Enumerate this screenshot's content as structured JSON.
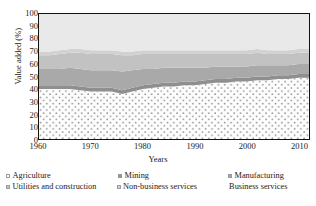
{
  "chart_data": {
    "type": "area",
    "title": "",
    "xlabel": "Years",
    "ylabel": "Value added (%)",
    "xlim": [
      1960,
      2012
    ],
    "ylim": [
      0,
      100
    ],
    "grid": false,
    "stacked": true,
    "legend_position": "bottom",
    "xticks": [
      1960,
      1970,
      1980,
      1990,
      2000,
      2010
    ],
    "yticks": [
      0,
      10,
      20,
      30,
      40,
      50,
      60,
      70,
      80,
      90,
      100
    ],
    "x": [
      1960,
      1962,
      1964,
      1966,
      1968,
      1970,
      1972,
      1974,
      1976,
      1978,
      1980,
      1982,
      1984,
      1986,
      1988,
      1990,
      1992,
      1994,
      1996,
      1998,
      2000,
      2002,
      2004,
      2006,
      2008,
      2010,
      2012
    ],
    "series": [
      {
        "name": "Agriculture",
        "color": "#fdfdfd",
        "pattern": "dots",
        "values": [
          40,
          40,
          40,
          40,
          39,
          38,
          38,
          38,
          36,
          38,
          40,
          41,
          42,
          42,
          43,
          43,
          44,
          45,
          45,
          46,
          46,
          47,
          47,
          48,
          48,
          49,
          49
        ]
      },
      {
        "name": "Mining",
        "color": "#8f8f8f",
        "values": [
          3,
          3,
          3,
          3,
          3,
          3,
          3,
          3,
          3,
          3,
          3,
          3,
          3,
          3,
          3,
          3,
          3,
          3,
          3,
          3,
          3,
          3,
          3,
          3,
          3,
          3,
          3
        ]
      },
      {
        "name": "Manufacturing",
        "color": "#a9a9a9",
        "values": [
          13,
          13,
          13,
          14,
          14,
          14,
          14,
          14,
          15,
          14,
          13,
          12,
          12,
          12,
          11,
          11,
          10,
          10,
          10,
          9,
          9,
          9,
          9,
          8,
          8,
          8,
          8
        ]
      },
      {
        "name": "Utilities and construction",
        "color": "#c2c2c2",
        "values": [
          11,
          11,
          12,
          12,
          13,
          13,
          13,
          13,
          13,
          12,
          12,
          12,
          11,
          11,
          11,
          11,
          11,
          10,
          10,
          10,
          10,
          10,
          9,
          9,
          9,
          9,
          9
        ]
      },
      {
        "name": "Non-business services",
        "color": "#d2d2d2",
        "values": [
          3,
          3,
          3,
          3,
          3,
          3,
          3,
          3,
          3,
          3,
          3,
          3,
          3,
          3,
          3,
          3,
          3,
          3,
          3,
          3,
          3,
          3,
          3,
          3,
          3,
          3,
          3
        ]
      },
      {
        "name": "Business services",
        "color": "#e9e9e9",
        "values": [
          30,
          30,
          29,
          28,
          28,
          29,
          29,
          29,
          30,
          30,
          29,
          29,
          29,
          29,
          29,
          29,
          29,
          29,
          29,
          29,
          29,
          28,
          29,
          29,
          29,
          28,
          28
        ]
      }
    ]
  },
  "axis": {
    "ylabel": "Value added (%)",
    "xlabel": "Years"
  },
  "legend": {
    "rows": [
      [
        {
          "label": "Agriculture",
          "swatch": "dots"
        },
        {
          "label": "Mining",
          "swatch": "solid"
        },
        {
          "label": "Manufacturing",
          "swatch": "solid"
        }
      ],
      [
        {
          "label": "Utilities and construction",
          "swatch": "solid"
        },
        {
          "label": "Non-business services",
          "swatch": "solid"
        },
        {
          "label": "Business services",
          "swatch": "none"
        }
      ]
    ]
  }
}
